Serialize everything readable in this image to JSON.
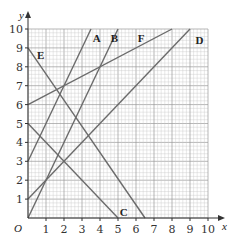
{
  "chart_data": {
    "type": "line",
    "title": "",
    "xlabel": "x",
    "ylabel": "y",
    "origin_label": "O",
    "xlim": [
      0,
      10
    ],
    "ylim": [
      0,
      10
    ],
    "grid": true,
    "grid_minor_step": 0.2,
    "grid_major_step": 1,
    "x_ticks": [
      "1",
      "2",
      "3",
      "4",
      "5",
      "6",
      "7",
      "8",
      "9",
      "10"
    ],
    "y_ticks": [
      "1",
      "2",
      "3",
      "4",
      "5",
      "6",
      "7",
      "8",
      "9",
      "10"
    ],
    "series": [
      {
        "name": "A",
        "equation": "y = 2x + 3",
        "points": [
          [
            0,
            3
          ],
          [
            3.5,
            10
          ]
        ],
        "label_pos": [
          3.6,
          9.5
        ]
      },
      {
        "name": "B",
        "equation": "y = 2x",
        "points": [
          [
            0,
            0
          ],
          [
            5,
            10
          ]
        ],
        "label_pos": [
          4.6,
          9.5
        ]
      },
      {
        "name": "C",
        "equation": "y = 5 - x",
        "points": [
          [
            0,
            5
          ],
          [
            5,
            0
          ]
        ],
        "label_pos": [
          5.1,
          0.3
        ]
      },
      {
        "name": "D",
        "equation": "y = x + 1",
        "points": [
          [
            0,
            1
          ],
          [
            9,
            10
          ]
        ],
        "label_pos": [
          9.3,
          9.4
        ]
      },
      {
        "name": "E",
        "equation": "y = 9 - 1.385x",
        "points": [
          [
            0,
            9
          ],
          [
            6.5,
            0
          ]
        ],
        "label_pos": [
          0.5,
          8.6
        ]
      },
      {
        "name": "F",
        "equation": "y = 0.5x + 6",
        "points": [
          [
            0,
            6
          ],
          [
            8,
            10
          ]
        ],
        "label_pos": [
          6.1,
          9.5
        ]
      }
    ],
    "line_color": "#6b6b6b",
    "grid_color": "#c8c8c8",
    "axis_color": "#333333"
  }
}
